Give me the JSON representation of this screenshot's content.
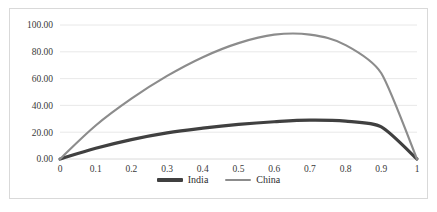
{
  "chart_data": {
    "type": "line",
    "title": "",
    "subtitle": "",
    "xlabel": "",
    "ylabel": "",
    "x": [
      0,
      0.1,
      0.2,
      0.3,
      0.4,
      0.5,
      0.6,
      0.7,
      0.8,
      0.9,
      1
    ],
    "categories": [
      "0",
      "0.1",
      "0.2",
      "0.3",
      "0.4",
      "0.5",
      "0.6",
      "0.7",
      "0.8",
      "0.9",
      "1"
    ],
    "series": [
      {
        "name": "India",
        "color": "#404040",
        "values": [
          0.0,
          8.0,
          14.5,
          19.5,
          23.0,
          25.8,
          27.8,
          29.0,
          28.2,
          24.0,
          0.0
        ]
      },
      {
        "name": "China",
        "color": "#8c8c8c",
        "values": [
          0.0,
          25.0,
          45.0,
          62.0,
          76.0,
          86.5,
          92.8,
          92.8,
          85.0,
          64.0,
          0.0
        ]
      }
    ],
    "ylim": [
      0,
      100
    ],
    "ytick_values": [
      0,
      20,
      40,
      60,
      80,
      100
    ],
    "ytick_labels": [
      "0.00",
      "20.00",
      "40.00",
      "60.00",
      "80.00",
      "100.00"
    ],
    "grid": "horizontal",
    "legend_position": "bottom",
    "border_color": "#d9d9d9",
    "gridline_color": "#e2e2e2",
    "background": "#ffffff"
  },
  "legend": {
    "items": [
      {
        "label": "India",
        "color": "#404040",
        "thickness": 3.2
      },
      {
        "label": "China",
        "color": "#8c8c8c",
        "thickness": 2.2
      }
    ]
  }
}
